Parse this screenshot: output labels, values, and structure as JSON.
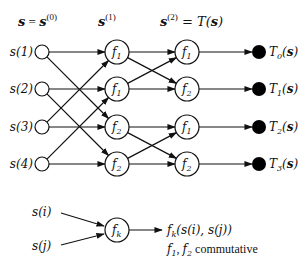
{
  "headers": {
    "col0": {
      "lhs": "s",
      "eq": " = ",
      "rhs": "s",
      "sup": "(0)"
    },
    "col1": {
      "base": "s",
      "sup": "(1)"
    },
    "col2": {
      "base": "s",
      "sup": "(2)",
      "eq": " = T(",
      "arg": "s",
      "close": ")"
    }
  },
  "inputs": [
    {
      "label": "s(1)"
    },
    {
      "label": "s(2)"
    },
    {
      "label": "s(3)"
    },
    {
      "label": "s(4)"
    }
  ],
  "layer1": [
    {
      "fn": "f",
      "sub": "1"
    },
    {
      "fn": "f",
      "sub": "1"
    },
    {
      "fn": "f",
      "sub": "2"
    },
    {
      "fn": "f",
      "sub": "2"
    }
  ],
  "layer2": [
    {
      "fn": "f",
      "sub": "1"
    },
    {
      "fn": "f",
      "sub": "2"
    },
    {
      "fn": "f",
      "sub": "1"
    },
    {
      "fn": "f",
      "sub": "2"
    }
  ],
  "outputs": [
    {
      "T": "T",
      "sub": "0",
      "arg": "s"
    },
    {
      "T": "T",
      "sub": "1",
      "arg": "s"
    },
    {
      "T": "T",
      "sub": "2",
      "arg": "s"
    },
    {
      "T": "T",
      "sub": "3",
      "arg": "s"
    }
  ],
  "edges_layer1": [
    [
      0,
      0
    ],
    [
      0,
      2
    ],
    [
      1,
      1
    ],
    [
      1,
      3
    ],
    [
      2,
      2
    ],
    [
      2,
      0
    ],
    [
      3,
      3
    ],
    [
      3,
      1
    ]
  ],
  "edges_layer2": [
    [
      0,
      0
    ],
    [
      0,
      1
    ],
    [
      1,
      1
    ],
    [
      1,
      0
    ],
    [
      2,
      2
    ],
    [
      2,
      3
    ],
    [
      3,
      3
    ],
    [
      3,
      2
    ]
  ],
  "legend": {
    "in_i": "s(i)",
    "in_j": "s(j)",
    "node": {
      "fn": "f",
      "sub": "k"
    },
    "result": {
      "fn": "f",
      "sub": "k",
      "args": "(s(i), s(j))"
    },
    "note_f1": {
      "fn": "f",
      "sub": "1"
    },
    "note_sep": ", ",
    "note_f2": {
      "fn": "f",
      "sub": "2"
    },
    "note_text": " commutative"
  }
}
